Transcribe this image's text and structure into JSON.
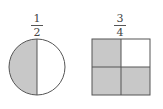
{
  "figures": [
    {
      "shape": "circle",
      "label": {
        "numerator": "1",
        "denominator": "2"
      },
      "parts": 2,
      "shaded": 1
    },
    {
      "shape": "square",
      "label": {
        "numerator": "3",
        "denominator": "4"
      },
      "parts": 4,
      "shaded": 3
    }
  ],
  "colors": {
    "shade": "#c8c8c8",
    "stroke": "#555555",
    "empty": "#ffffff"
  }
}
